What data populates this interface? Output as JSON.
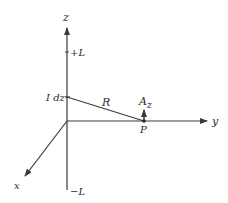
{
  "diagram": {
    "axes": {
      "z_label": "z",
      "y_label": "y",
      "x_label": "x"
    },
    "markers": {
      "plus_L": "+L",
      "minus_L": "−L"
    },
    "element": {
      "current_element": "I dz",
      "distance": "R",
      "point": "P",
      "vector_potential": "A",
      "vector_potential_subscript": "z"
    },
    "colors": {
      "line": "#3a3a3a",
      "background": "#ffffff"
    }
  }
}
